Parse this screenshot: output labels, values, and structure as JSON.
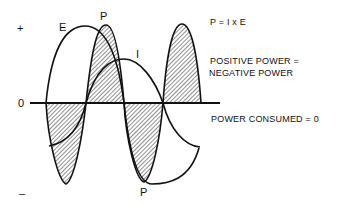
{
  "axis": {
    "plus": "+",
    "minus": "–",
    "zero": "0"
  },
  "curves": {
    "e": "E",
    "i": "I",
    "p_top": "P",
    "p_bottom": "P"
  },
  "annotations": {
    "formula": "P = I x E",
    "power_balance_1": "POSITIVE POWER =",
    "power_balance_2": "NEGATIVE POWER",
    "consumed": "POWER CONSUMED = 0"
  },
  "colors": {
    "ink": "#111111",
    "background": "#ffffff"
  }
}
